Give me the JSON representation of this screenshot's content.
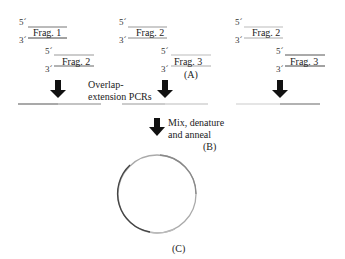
{
  "diagram": {
    "groups": [
      {
        "top": {
          "five_prime": "5´",
          "three_prime": "3´",
          "label": "Frag. 1"
        },
        "bottom": {
          "five_prime": "5´",
          "three_prime": "3´",
          "label": "Frag. 2"
        }
      },
      {
        "top": {
          "five_prime": "5´",
          "three_prime": "3´",
          "label": "Frag. 2"
        },
        "bottom": {
          "five_prime": "5´",
          "three_prime": "3´",
          "label": "Frag. 3"
        },
        "step_label": "(A)"
      },
      {
        "top": {
          "five_prime": "5´",
          "three_prime": "3´",
          "label": "Frag. 2"
        },
        "bottom": {
          "five_prime": "5´",
          "three_prime": "3´",
          "label": "Frag. 3"
        }
      }
    ],
    "pcr_label_line1": "Overlap-",
    "pcr_label_line2": "extension PCRs",
    "mix_label_line1": "Mix, denature",
    "mix_label_line2": "and anneal",
    "mix_step_label": "(B)",
    "circle_step_label": "(C)",
    "colors": {
      "dark_strand": "#555555",
      "light_strand": "#b5b5b5",
      "arrow": "#111111",
      "text": "#222222"
    }
  }
}
